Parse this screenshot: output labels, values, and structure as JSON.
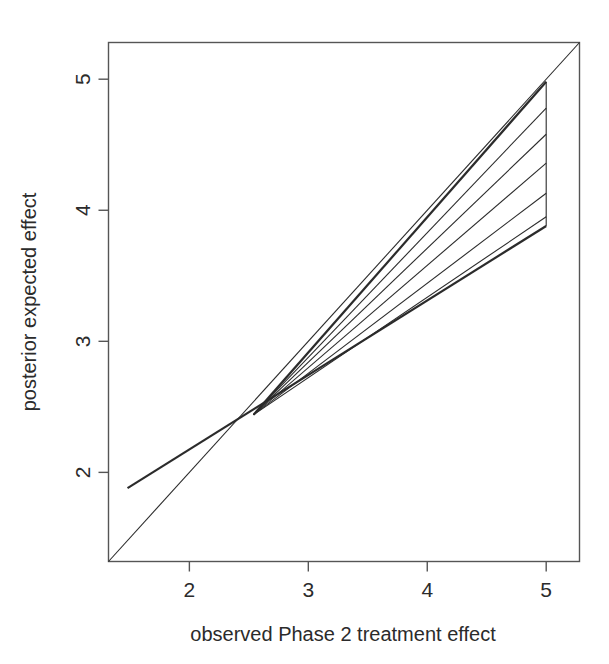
{
  "chart_data": {
    "type": "line",
    "title": "",
    "subtitle": "",
    "xlabel": "observed Phase 2 treatment effect",
    "ylabel": "posterior expected effect",
    "xlim": [
      1.32,
      5.28
    ],
    "ylim": [
      1.32,
      5.28
    ],
    "xticks": [
      2,
      3,
      4,
      5
    ],
    "yticks": [
      2,
      3,
      4,
      5
    ],
    "xtick_labels": [
      "2",
      "3",
      "4",
      "5"
    ],
    "ytick_labels": [
      "2",
      "3",
      "4",
      "5"
    ],
    "grid": false,
    "legend": "none",
    "box_border": true,
    "annotations": [],
    "series": [
      {
        "name": "identity line (y = x)",
        "style": "thin",
        "x": [
          1.32,
          5.28
        ],
        "y": [
          1.32,
          5.28
        ]
      },
      {
        "name": "lower shrinkage bound",
        "style": "thick",
        "x": [
          1.48,
          5.0
        ],
        "y": [
          1.88,
          3.88
        ]
      },
      {
        "name": "upper shrinkage bound",
        "style": "thick",
        "x": [
          2.54,
          5.0
        ],
        "y": [
          2.44,
          4.98
        ]
      },
      {
        "name": "fan line 1",
        "style": "thin",
        "x": [
          2.54,
          5.0
        ],
        "y": [
          2.44,
          4.78
        ]
      },
      {
        "name": "fan line 2",
        "style": "thin",
        "x": [
          2.54,
          5.0
        ],
        "y": [
          2.44,
          4.58
        ]
      },
      {
        "name": "fan line 3",
        "style": "thin",
        "x": [
          2.54,
          5.0
        ],
        "y": [
          2.44,
          4.36
        ]
      },
      {
        "name": "fan line 4",
        "style": "thin",
        "x": [
          2.54,
          5.0
        ],
        "y": [
          2.44,
          4.13
        ]
      },
      {
        "name": "fan line 5",
        "style": "thin",
        "x": [
          2.54,
          5.0
        ],
        "y": [
          2.44,
          3.95
        ]
      },
      {
        "name": "right closing segment at x = 5",
        "style": "thin",
        "x": [
          5.0,
          5.0
        ],
        "y": [
          3.88,
          4.98
        ]
      }
    ],
    "crossing_point": {
      "x": 2.54,
      "y": 2.44
    }
  },
  "axes": {
    "x_title": "observed Phase 2 treatment effect",
    "y_title": "posterior expected effect",
    "x_ticks": [
      "2",
      "3",
      "4",
      "5"
    ],
    "y_ticks": [
      "2",
      "3",
      "4",
      "5"
    ]
  },
  "colors": {
    "line": "#2b2b2b",
    "axis": "#555555",
    "background": "#ffffff",
    "text": "#2b2b2b"
  }
}
